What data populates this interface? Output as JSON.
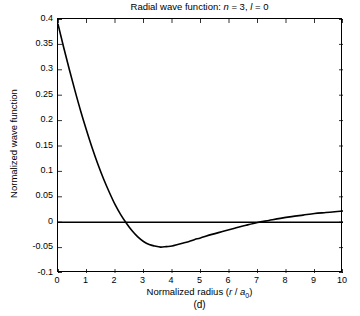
{
  "figure": {
    "caption": "(d)",
    "title_prefix": "Radial wave function: ",
    "title_n_sym": "n",
    "title_n_val": " = 3, ",
    "title_l_sym": "l",
    "title_l_val": " = 0"
  },
  "axes": {
    "xlabel_prefix": "Normalized radius (",
    "xlabel_r": "r",
    "xlabel_slash": " / ",
    "xlabel_a": "a",
    "xlabel_sub": "0",
    "xlabel_suffix": ")",
    "ylabel": "Normalized wave function"
  },
  "chart_data": {
    "type": "line",
    "title": "Radial wave function: n = 3, l = 0",
    "xlabel": "Normalized radius (r / a0)",
    "ylabel": "Normalized wave function",
    "xlim": [
      0,
      10
    ],
    "ylim": [
      -0.1,
      0.4
    ],
    "xticks": [
      0,
      1,
      2,
      3,
      4,
      5,
      6,
      7,
      8,
      9,
      10
    ],
    "xtick_labels": [
      "0",
      "1",
      "2",
      "3",
      "4",
      "5",
      "6",
      "7",
      "8",
      "9",
      "10"
    ],
    "yticks": [
      -0.1,
      -0.05,
      0,
      0.05,
      0.1,
      0.15,
      0.2,
      0.25,
      0.3,
      0.35,
      0.4
    ],
    "ytick_labels": [
      "-0.1",
      "-0.05",
      "0",
      "0.05",
      "0.1",
      "0.15",
      "0.2",
      "0.25",
      "0.3",
      "0.35",
      "0.4"
    ],
    "grid": false,
    "legend": null,
    "line_color": "#000000",
    "line_width": 1.6,
    "zero_line": {
      "y": 0,
      "color": "#000000",
      "width": 1.6
    },
    "annotations": [
      {
        "text": "first zero crossing",
        "x": 1.73,
        "y": 0
      },
      {
        "text": "minimum",
        "x": 3.7,
        "y": -0.048
      },
      {
        "text": "second zero crossing",
        "x": 7.02,
        "y": 0
      }
    ],
    "series": [
      {
        "name": "R(3,0)",
        "x": [
          0.0,
          0.2,
          0.4,
          0.6,
          0.8,
          1.0,
          1.2,
          1.4,
          1.6,
          1.8,
          2.0,
          2.2,
          2.4,
          2.6,
          2.8,
          3.0,
          3.2,
          3.4,
          3.6,
          3.8,
          4.0,
          4.2,
          4.4,
          4.6,
          4.8,
          5.0,
          5.4,
          5.8,
          6.2,
          6.6,
          7.0,
          7.4,
          7.8,
          8.2,
          8.6,
          9.0,
          9.4,
          9.8,
          10.0
        ],
        "y": [
          0.39,
          0.344,
          0.3,
          0.258,
          0.218,
          0.181,
          0.146,
          0.114,
          0.085,
          0.059,
          0.035,
          0.015,
          -0.002,
          -0.017,
          -0.029,
          -0.038,
          -0.044,
          -0.047,
          -0.049,
          -0.048,
          -0.047,
          -0.044,
          -0.041,
          -0.038,
          -0.034,
          -0.031,
          -0.024,
          -0.018,
          -0.012,
          -0.006,
          -0.0005,
          0.0035,
          0.0075,
          0.011,
          0.014,
          0.017,
          0.019,
          0.021,
          0.022
        ]
      }
    ]
  }
}
